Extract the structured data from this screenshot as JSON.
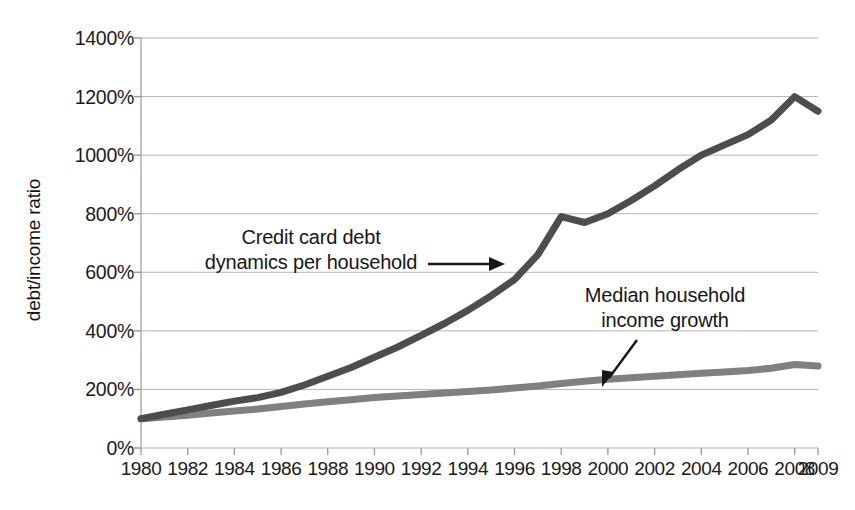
{
  "chart_data": {
    "type": "line",
    "title": "",
    "xlabel": "",
    "ylabel": "debt/income ratio",
    "xlim": [
      1980,
      2009
    ],
    "ylim": [
      0,
      1400
    ],
    "grid": true,
    "legend": "annotations",
    "x_tick_labels": [
      "1980",
      "1982",
      "1984",
      "1986",
      "1988",
      "1990",
      "1992",
      "1994",
      "1996",
      "1998",
      "2000",
      "2002",
      "2004",
      "2006",
      "2008",
      "2009"
    ],
    "x_tick_values": [
      1980,
      1982,
      1984,
      1986,
      1988,
      1990,
      1992,
      1994,
      1996,
      1998,
      2000,
      2002,
      2004,
      2006,
      2008,
      2009
    ],
    "y_tick_labels": [
      "0%",
      "200%",
      "400%",
      "600%",
      "800%",
      "1000%",
      "1200%",
      "1400%"
    ],
    "y_tick_values": [
      0,
      200,
      400,
      600,
      800,
      1000,
      1200,
      1400
    ],
    "x": [
      1980,
      1981,
      1982,
      1983,
      1984,
      1985,
      1986,
      1987,
      1988,
      1989,
      1990,
      1991,
      1992,
      1993,
      1994,
      1995,
      1996,
      1997,
      1998,
      1999,
      2000,
      2001,
      2002,
      2003,
      2004,
      2005,
      2006,
      2007,
      2008,
      2009
    ],
    "series": [
      {
        "name": "Credit card debt dynamics per household",
        "color": "#4d4d4d",
        "values": [
          100,
          115,
          130,
          145,
          160,
          172,
          190,
          215,
          245,
          275,
          310,
          345,
          385,
          425,
          470,
          520,
          575,
          660,
          790,
          770,
          800,
          845,
          895,
          950,
          1000,
          1035,
          1070,
          1120,
          1200,
          1150
        ]
      },
      {
        "name": "Median household income growth",
        "color": "#808080",
        "values": [
          100,
          106,
          112,
          119,
          126,
          133,
          142,
          150,
          158,
          165,
          172,
          178,
          183,
          188,
          193,
          198,
          205,
          212,
          220,
          228,
          235,
          240,
          245,
          250,
          255,
          260,
          265,
          272,
          285,
          280
        ]
      }
    ],
    "annotations": [
      {
        "name": "credit-card-debt-annotation",
        "lines": [
          "Credit card debt",
          "dynamics per household"
        ],
        "arrow": "right"
      },
      {
        "name": "median-income-annotation",
        "lines": [
          "Median household",
          "income growth"
        ],
        "arrow": "down-left"
      }
    ]
  },
  "colors": {
    "debt_line": "#4d4d4d",
    "income_line": "#808080",
    "grid": "#b5b5b5",
    "axis": "#9a9a9a",
    "text": "#1a1a1a"
  }
}
